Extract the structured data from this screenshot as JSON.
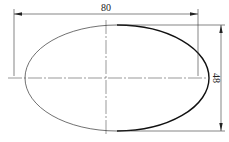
{
  "drawing": {
    "shape": "ellipse",
    "dimensions": {
      "width": {
        "label": "80"
      },
      "height": {
        "label": "48"
      }
    },
    "colors": {
      "line": "#222222",
      "background": "#ffffff"
    }
  }
}
